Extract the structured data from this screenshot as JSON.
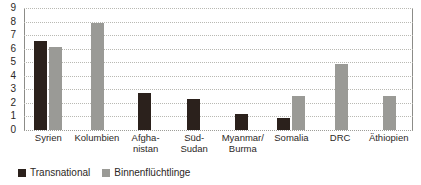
{
  "chart_data": {
    "type": "bar",
    "title": "",
    "xlabel": "",
    "ylabel": "",
    "ylim": [
      0,
      9
    ],
    "yticks": [
      0,
      1,
      2,
      3,
      4,
      5,
      6,
      7,
      8,
      9
    ],
    "grid": true,
    "legend_position": "bottom-left",
    "categories": [
      "Syrien",
      "Kolumbien",
      "Afgha-\nnistan",
      "Süd-\nSudan",
      "Myanmar/\nBurma",
      "Somalia",
      "DRC",
      "Äthiopien"
    ],
    "series": [
      {
        "name": "Transnational",
        "color": "#2b211c",
        "values": [
          6.6,
          0,
          2.7,
          2.3,
          1.15,
          0.9,
          0,
          0
        ]
      },
      {
        "name": "Binnenflüchtlinge",
        "color": "#9a9a96",
        "values": [
          6.1,
          7.9,
          0,
          0,
          0,
          2.5,
          4.9,
          2.5
        ]
      }
    ]
  },
  "legend": {
    "items": [
      {
        "label": "Transnational",
        "color": "#2b211c"
      },
      {
        "label": "Binnenflüchtlinge",
        "color": "#9a9a96"
      }
    ]
  },
  "colors": {
    "series_dark": "#2b211c",
    "series_gray": "#9a9a96",
    "gridline": "#b9b9b3",
    "axis": "#8c8c88",
    "text": "#2c2825",
    "background": "#ffffff"
  }
}
